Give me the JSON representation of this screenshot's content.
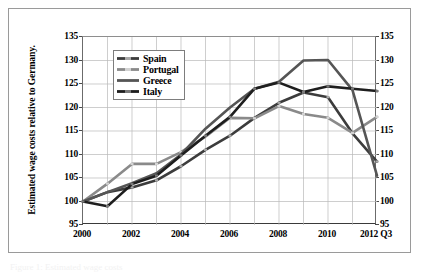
{
  "figure": {
    "caption_fragment": "Figure 1: Estimated wage costs"
  },
  "axes": {
    "y_title": "Estimated wage costs relative to Germany.",
    "y_ticks": [
      "135",
      "130",
      "125",
      "120",
      "115",
      "110",
      "105",
      "100",
      "95"
    ],
    "y_ticks_right": [
      "135",
      "130",
      "125",
      "120",
      "115",
      "110",
      "105",
      "100",
      "95"
    ],
    "x_ticks": [
      "2000",
      "2002",
      "2004",
      "2006",
      "2008",
      "2010",
      "2012 Q3"
    ]
  },
  "legend": {
    "position": "top-left-inside",
    "items": [
      {
        "label": "Spain",
        "color": "#3c3c3c",
        "marker": "#a8a8a8",
        "style": "marked"
      },
      {
        "label": "Portugal",
        "color": "#8a8a8a",
        "marker": "#d2d2d2",
        "style": "marked"
      },
      {
        "label": "Greece",
        "color": "#555555",
        "marker": "#555555",
        "style": "plain"
      },
      {
        "label": "Italy",
        "color": "#1e1e1e",
        "marker": "#7a7a7a",
        "style": "marked"
      }
    ]
  },
  "chart_data": {
    "type": "line",
    "title": "",
    "xlabel": "",
    "ylabel": "Estimated wage costs relative to Germany.",
    "x": [
      "2000",
      "2001",
      "2002",
      "2003",
      "2004",
      "2005",
      "2006",
      "2007",
      "2008",
      "2009",
      "2010",
      "2011",
      "2012 Q3"
    ],
    "xlim": [
      2000,
      2012
    ],
    "ylim": [
      95,
      135
    ],
    "ytick_step": 5,
    "grid": true,
    "series": [
      {
        "name": "Spain",
        "color": "#3c3c3c",
        "values": [
          100.0,
          102.0,
          103.0,
          104.5,
          107.5,
          111.0,
          114.0,
          117.8,
          121.0,
          123.2,
          122.2,
          114.5,
          108.5
        ]
      },
      {
        "name": "Portugal",
        "color": "#8a8a8a",
        "values": [
          100.0,
          103.8,
          108.0,
          108.0,
          110.5,
          113.8,
          117.8,
          117.7,
          120.3,
          118.6,
          117.8,
          114.6,
          118.0
        ]
      },
      {
        "name": "Greece",
        "color": "#555555",
        "values": [
          100.0,
          102.0,
          103.9,
          106.0,
          110.0,
          115.5,
          120.0,
          124.0,
          125.5,
          130.0,
          130.1,
          123.7,
          105.5
        ]
      },
      {
        "name": "Italy",
        "color": "#1e1e1e",
        "values": [
          100.0,
          99.0,
          103.7,
          105.5,
          109.8,
          114.0,
          118.0,
          124.0,
          125.3,
          123.3,
          124.5,
          124.0,
          123.5
        ]
      }
    ]
  }
}
